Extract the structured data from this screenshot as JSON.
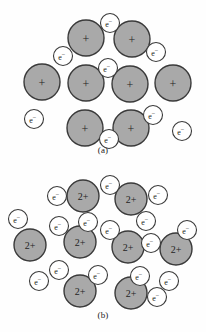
{
  "figure": {
    "background_color": "#fefefe",
    "cation_fill_color": "#a9a9a9",
    "cation_stroke_color": "#3a3a3a",
    "electron_fill_color": "#ffffff",
    "electron_stroke_color": "#3a3a3a",
    "text_color": "#1d1d1d"
  },
  "panels": [
    {
      "id": "a",
      "caption": "(a)",
      "cation_label": "+",
      "electron_label": "e",
      "electron_superscript": "−",
      "cation_radius": 18,
      "electron_radius": 9.5,
      "cation_font_size": 12,
      "electron_font_size": 8,
      "cations": [
        {
          "name": "cation-a-1",
          "cx": 86,
          "cy": 38
        },
        {
          "name": "cation-a-2",
          "cx": 132,
          "cy": 39
        },
        {
          "name": "cation-a-3",
          "cx": 42,
          "cy": 82
        },
        {
          "name": "cation-a-4",
          "cx": 86,
          "cy": 83
        },
        {
          "name": "cation-a-5",
          "cx": 130,
          "cy": 84
        },
        {
          "name": "cation-a-6",
          "cx": 173,
          "cy": 83
        },
        {
          "name": "cation-a-7",
          "cx": 85,
          "cy": 128
        },
        {
          "name": "cation-a-8",
          "cx": 131,
          "cy": 128
        }
      ],
      "electrons": [
        {
          "name": "electron-a-1",
          "cx": 110,
          "cy": 23
        },
        {
          "name": "electron-a-2",
          "cx": 63,
          "cy": 56
        },
        {
          "name": "electron-a-3",
          "cx": 156,
          "cy": 52
        },
        {
          "name": "electron-a-4",
          "cx": 108,
          "cy": 68
        },
        {
          "name": "electron-a-5",
          "cx": 34,
          "cy": 119
        },
        {
          "name": "electron-a-6",
          "cx": 153,
          "cy": 115
        },
        {
          "name": "electron-a-7",
          "cx": 109,
          "cy": 139
        },
        {
          "name": "electron-a-8",
          "cx": 182,
          "cy": 131
        }
      ]
    },
    {
      "id": "b",
      "caption": "(b)",
      "cation_label": "2+",
      "electron_label": "e",
      "electron_superscript": "−",
      "cation_radius": 16,
      "electron_radius": 9.5,
      "cation_font_size": 10,
      "electron_font_size": 8,
      "cations": [
        {
          "name": "cation-b-1",
          "cx": 83,
          "cy": 196
        },
        {
          "name": "cation-b-2",
          "cx": 131,
          "cy": 199
        },
        {
          "name": "cation-b-3",
          "cx": 30,
          "cy": 245
        },
        {
          "name": "cation-b-4",
          "cx": 80,
          "cy": 242
        },
        {
          "name": "cation-b-5",
          "cx": 128,
          "cy": 247
        },
        {
          "name": "cation-b-6",
          "cx": 176,
          "cy": 249
        },
        {
          "name": "cation-b-7",
          "cx": 80,
          "cy": 291
        },
        {
          "name": "cation-b-8",
          "cx": 131,
          "cy": 293
        }
      ],
      "electrons": [
        {
          "name": "electron-b-1",
          "cx": 57,
          "cy": 196
        },
        {
          "name": "electron-b-2",
          "cx": 110,
          "cy": 185
        },
        {
          "name": "electron-b-3",
          "cx": 158,
          "cy": 195
        },
        {
          "name": "electron-b-4",
          "cx": 18,
          "cy": 219
        },
        {
          "name": "electron-b-5",
          "cx": 59,
          "cy": 226
        },
        {
          "name": "electron-b-6",
          "cx": 88,
          "cy": 222
        },
        {
          "name": "electron-b-7",
          "cx": 110,
          "cy": 230
        },
        {
          "name": "electron-b-8",
          "cx": 146,
          "cy": 221
        },
        {
          "name": "electron-b-9",
          "cx": 151,
          "cy": 243
        },
        {
          "name": "electron-b-10",
          "cx": 187,
          "cy": 230
        },
        {
          "name": "electron-b-11",
          "cx": 59,
          "cy": 270
        },
        {
          "name": "electron-b-12",
          "cx": 39,
          "cy": 281
        },
        {
          "name": "electron-b-13",
          "cx": 98,
          "cy": 275
        },
        {
          "name": "electron-b-14",
          "cx": 140,
          "cy": 276
        },
        {
          "name": "electron-b-15",
          "cx": 169,
          "cy": 281
        },
        {
          "name": "electron-b-16",
          "cx": 157,
          "cy": 297
        }
      ]
    }
  ]
}
